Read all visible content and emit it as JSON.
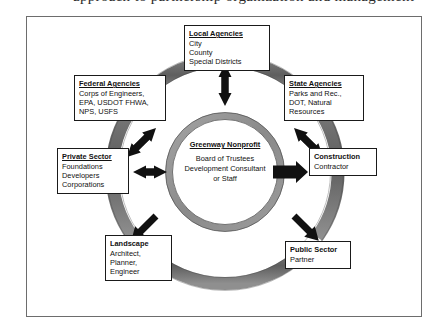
{
  "caption": {
    "text": "approach to partnership organization and management"
  },
  "figure": {
    "frame_border_color": "#6d6d6d",
    "background": "#ffffff"
  },
  "rings": {
    "outer_ring_color": "#6b6b6b",
    "outer_ring_shade_color": "#555555",
    "inner_ring_color": "#8c8c8c",
    "inner_ring_fill": "#ffffff",
    "description": "Segmented dark gray outer ring with four gaps, and a narrower gray inner ring enclosing the center organization."
  },
  "center": {
    "title": "Greenway Nonprofit",
    "lines": [
      "Board of Trustees",
      "Development Consultant",
      "or Staff"
    ]
  },
  "nodes": [
    {
      "id": "local-agencies",
      "title": "Local Agencies",
      "title_underlined": true,
      "lines": [
        "City",
        "County",
        "Special Districts"
      ],
      "arrow": "double",
      "direction": "vertical"
    },
    {
      "id": "federal-agencies",
      "title": "Federal Agencies",
      "title_underlined": true,
      "lines": [
        "Corps of Engineers,",
        "EPA, USDOT FHWA,",
        "NPS, USFS"
      ],
      "arrow": "double",
      "direction": "diagonal-ne-sw"
    },
    {
      "id": "state-agencies",
      "title": "State Agencies",
      "title_underlined": true,
      "lines": [
        "Parks and Rec.,",
        "DOT, Natural",
        "Resources"
      ],
      "arrow": "double",
      "direction": "diagonal-nw-se"
    },
    {
      "id": "private-sector",
      "title": "Private Sector",
      "title_underlined": true,
      "lines": [
        "Foundations",
        "Developers",
        "Corporations"
      ],
      "arrow": "double",
      "direction": "horizontal"
    },
    {
      "id": "construction-contractor",
      "title": "Construction",
      "title_underlined": false,
      "lines": [
        "Contractor"
      ],
      "arrow": "single-out",
      "direction": "horizontal-right"
    },
    {
      "id": "landscape-architect",
      "title": "Landscape",
      "title_underlined": false,
      "lines": [
        "Architect,",
        "Planner,",
        "Engineer"
      ],
      "arrow": "single-out",
      "direction": "diagonal-down-left"
    },
    {
      "id": "public-sector-partner",
      "title": "Public Sector",
      "title_underlined": false,
      "lines": [
        "Partner"
      ],
      "arrow": "single-out",
      "direction": "diagonal-down-right"
    }
  ],
  "arrows": {
    "color": "#111111"
  }
}
